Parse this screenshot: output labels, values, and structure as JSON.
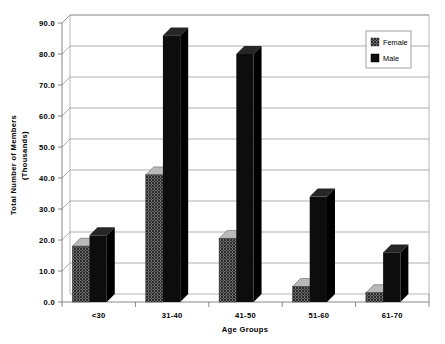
{
  "chart_data": {
    "type": "bar",
    "title": "",
    "subtitle": "",
    "xlabel": "Age Groups",
    "ylabel": "Total Number of Members (Thousands)",
    "ylabel_line1": "Total Number of Members",
    "ylabel_line2": "(Thousands)",
    "categories": [
      "<30",
      "31-40",
      "41-50",
      "51-60",
      "61-70"
    ],
    "series": [
      {
        "name": "Female",
        "values": [
          18.0,
          41.0,
          20.5,
          5.0,
          3.0
        ]
      },
      {
        "name": "Male",
        "values": [
          21.5,
          86.0,
          80.0,
          34.0,
          16.0
        ]
      }
    ],
    "ylim": [
      0.0,
      90.0
    ],
    "ytick_step": 10.0,
    "ytick_labels": [
      "0.0",
      "10.0",
      "20.0",
      "30.0",
      "40.0",
      "50.0",
      "60.0",
      "70.0",
      "80.0",
      "90.0"
    ],
    "ytick_values": [
      0.0,
      10.0,
      20.0,
      30.0,
      40.0,
      50.0,
      60.0,
      70.0,
      80.0,
      90.0
    ],
    "grid": true,
    "grid_axis": "y",
    "legend_position": "top-right-inside",
    "legend_entries": [
      {
        "label": "Female",
        "swatch": "hatch-crosshatch"
      },
      {
        "label": "Male",
        "swatch": "solid-black"
      }
    ],
    "style": "3d-perspective",
    "colors": {
      "male": "#0d0d0d",
      "female_pattern": "#808080",
      "gridline": "#8d8d8d",
      "axis": "#6a6a6a",
      "background": "#ffffff",
      "text": "#000000"
    }
  }
}
